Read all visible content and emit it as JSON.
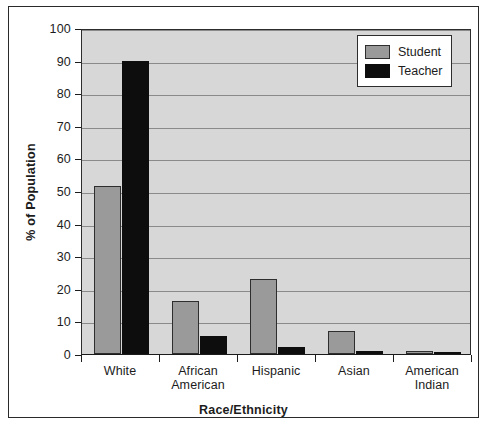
{
  "chart_data": {
    "type": "bar",
    "title": "",
    "xlabel": "Race/Ethnicity",
    "ylabel": "% of Population",
    "categories": [
      "White",
      "African American",
      "Hispanic",
      "Asian",
      "American Indian"
    ],
    "series": [
      {
        "name": "Student",
        "color": "#9a9a9a",
        "values": [
          51.5,
          16.3,
          23.0,
          7.2,
          1.0
        ]
      },
      {
        "name": "Teacher",
        "color": "#0d0d0d",
        "values": [
          90.0,
          5.5,
          2.0,
          1.0,
          0.5
        ]
      }
    ],
    "ylim": [
      0,
      100
    ],
    "yticks": [
      0,
      10,
      20,
      30,
      40,
      50,
      60,
      70,
      80,
      90,
      100
    ],
    "grid": true,
    "legend_position": "top-right",
    "plot_background": "#d7d7d7",
    "frame_color": "#2a2a2a"
  },
  "legend": {
    "items": [
      {
        "label": "Student"
      },
      {
        "label": "Teacher"
      }
    ]
  }
}
